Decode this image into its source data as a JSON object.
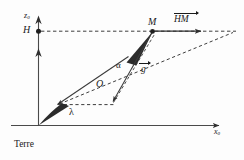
{
  "figure": {
    "caption": "Terre",
    "axes": {
      "vertical_label": "z",
      "vertical_label_sub": "0",
      "horizontal_label": "x",
      "horizontal_label_sub": "0"
    },
    "points": [
      {
        "id": "point-h",
        "label": "H"
      },
      {
        "id": "point-m",
        "label": "M"
      }
    ],
    "angles": [
      {
        "id": "angle-alpha",
        "label": "α"
      },
      {
        "id": "angle-lambda",
        "label": "λ"
      }
    ],
    "segments": [
      {
        "id": "segment-o",
        "label": "O"
      }
    ],
    "vectors": [
      {
        "id": "vector-hm",
        "label": "HM"
      },
      {
        "id": "vector-g",
        "label": "g"
      }
    ],
    "colors": {
      "stroke": "#3a3a3a",
      "text": "#1a1a1a",
      "wedge_fill": "#2b2b2b",
      "background": "#fdfdfd"
    }
  }
}
